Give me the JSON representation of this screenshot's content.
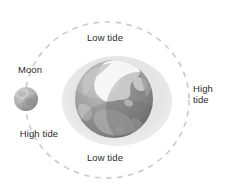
{
  "diagram": {
    "background_color": "#ffffff",
    "text_color": "#2b2b2b",
    "labels": {
      "low_tide_top": "Low tide",
      "low_tide_bottom": "Low tide",
      "high_tide_left": "High tide",
      "high_tide_right": "High\ntide",
      "moon": "Moon"
    },
    "orbit": {
      "style": "dashed",
      "color": "#c9c9c9",
      "center_x": 107,
      "center_y": 100,
      "radius_x": 82,
      "radius_y": 78
    },
    "tidal_bulge": {
      "color": "#e3e3e3",
      "center_x": 117,
      "center_y": 101,
      "radius_x": 55,
      "radius_y": 45
    },
    "earth": {
      "center_x": 114,
      "center_y": 99,
      "radius": 39,
      "ocean_color": "#9a9a9a",
      "land_color": "#b4b4b4",
      "ice_color": "#f7f7f7",
      "shadow_color": "#6f6f6f"
    },
    "moon": {
      "center_x": 26,
      "center_y": 99,
      "radius": 12,
      "body_color": "#b9b9b9",
      "shadow_color": "#8e8e8e"
    }
  }
}
